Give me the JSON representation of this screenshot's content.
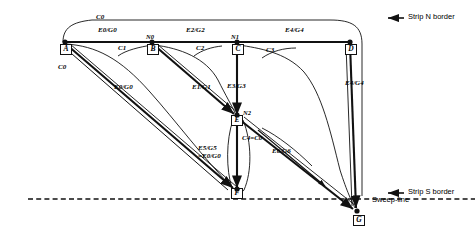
{
  "diagram": {
    "nodes": [
      {
        "id": "A",
        "label": "A",
        "x": 65,
        "y": 42,
        "tag": ""
      },
      {
        "id": "B",
        "label": "B",
        "x": 152,
        "y": 42,
        "tag": "N0"
      },
      {
        "id": "C",
        "label": "C",
        "x": 237,
        "y": 42,
        "tag": "N1"
      },
      {
        "id": "D",
        "label": "D",
        "x": 350,
        "y": 42,
        "tag": ""
      },
      {
        "id": "E",
        "label": "E",
        "x": 237,
        "y": 117,
        "tag": "N2"
      },
      {
        "id": "F",
        "label": "F",
        "x": 237,
        "y": 190,
        "tag": ""
      },
      {
        "id": "G",
        "label": "G",
        "x": 358,
        "y": 212,
        "tag": ""
      }
    ],
    "edge_labels": [
      {
        "name": "edge-label-c0-top",
        "text": "C0",
        "x": 96,
        "y": 20
      },
      {
        "name": "edge-label-e0g0-top",
        "text": "E0/G0",
        "x": 98,
        "y": 31
      },
      {
        "name": "edge-label-e2g2",
        "text": "E2/G2",
        "x": 186,
        "y": 31
      },
      {
        "name": "edge-label-e4g4-top",
        "text": "E4/G4",
        "x": 285,
        "y": 31
      },
      {
        "name": "edge-label-c1",
        "text": "C1",
        "x": 120,
        "y": 50
      },
      {
        "name": "edge-label-c2",
        "text": "C2",
        "x": 196,
        "y": 50
      },
      {
        "name": "edge-label-c3",
        "text": "C3",
        "x": 268,
        "y": 52
      },
      {
        "name": "edge-label-c0-left",
        "text": "C0",
        "x": 60,
        "y": 68
      },
      {
        "name": "edge-label-e0g0-left",
        "text": "E0/G0",
        "x": 116,
        "y": 88
      },
      {
        "name": "edge-label-e1g1",
        "text": "E1/G1",
        "x": 194,
        "y": 88
      },
      {
        "name": "edge-label-e3g3",
        "text": "E3/G3",
        "x": 229,
        "y": 87
      },
      {
        "name": "edge-label-e4g4-right",
        "text": "E4/G4",
        "x": 347,
        "y": 84
      },
      {
        "name": "edge-label-c4c0",
        "text": "C4=C0",
        "x": 244,
        "y": 139
      },
      {
        "name": "edge-label-e6g6",
        "text": "E6/G6",
        "x": 274,
        "y": 152
      }
    ],
    "stacked_label": {
      "name": "edge-label-e5g5-e0g0",
      "line1": "E5/G5",
      "line2": "=E0/G0",
      "x": 200,
      "y": 149
    },
    "annotations": [
      {
        "name": "strip-n-border-label",
        "text": "Strip N border",
        "x": 406,
        "y": 15
      },
      {
        "name": "strip-s-border-label",
        "text": "Strip S border",
        "x": 406,
        "y": 190
      },
      {
        "name": "sweep-line-label",
        "text": "Sweep-line",
        "x": 372,
        "y": 197
      }
    ],
    "sweep_line": {
      "name": "sweep-line",
      "y": 199,
      "x1": 28,
      "x2": 475
    }
  }
}
